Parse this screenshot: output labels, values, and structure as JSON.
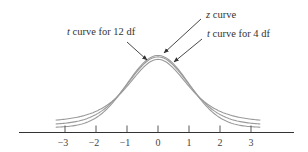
{
  "chart_data": {
    "type": "line",
    "title": "",
    "xlabel": "",
    "ylabel": "",
    "xlim": [
      -3.3,
      3.3
    ],
    "x_ticks": [
      -3,
      -2,
      -1,
      0,
      1,
      2,
      3
    ],
    "x_tick_labels": [
      "−3",
      "−2",
      "−1",
      "0",
      "1",
      "2",
      "3"
    ],
    "series": [
      {
        "name": "z curve",
        "kind": "standard normal",
        "df": null
      },
      {
        "name": "t curve for 12 df",
        "kind": "t",
        "df": 12
      },
      {
        "name": "t curve for 4 df",
        "kind": "t",
        "df": 4
      }
    ],
    "annotations": [
      {
        "text_italic": "z",
        "text": " curve",
        "points_to": "z curve"
      },
      {
        "text_italic": "t",
        "text": " curve for 12 df",
        "points_to": "t curve for 12 df"
      },
      {
        "text_italic": "t",
        "text": " curve for 4 df",
        "points_to": "t curve for 4 df"
      }
    ],
    "grid": false,
    "legend": "arrow annotations"
  },
  "colors": {
    "curve": "#9a9a9a",
    "axis": "#333333",
    "text": "#333333"
  }
}
